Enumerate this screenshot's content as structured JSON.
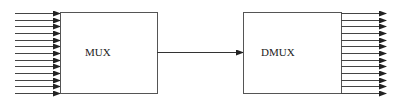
{
  "diagram": {
    "colors": {
      "stroke": "#555555",
      "arrow": "#222222",
      "text": "#222222",
      "background": "#ffffff"
    },
    "blocks": [
      {
        "id": "mux",
        "label": "MUX",
        "x": 60,
        "y": 12,
        "w": 97,
        "h": 81,
        "label_x": 85,
        "label_y": 56
      },
      {
        "id": "dmux",
        "label": "DMUX",
        "x": 243,
        "y": 12,
        "w": 98,
        "h": 81,
        "label_x": 261,
        "label_y": 56
      }
    ],
    "input_lines": {
      "count": 13,
      "x_start": 15,
      "x_end": 60,
      "y_first": 13,
      "y_last": 93
    },
    "link": {
      "from": "mux",
      "to": "dmux",
      "x_start": 157,
      "x_end": 243,
      "y": 52
    },
    "output_lines": {
      "count": 13,
      "x_start": 341,
      "x_end": 386,
      "y_first": 13,
      "y_last": 93
    }
  }
}
